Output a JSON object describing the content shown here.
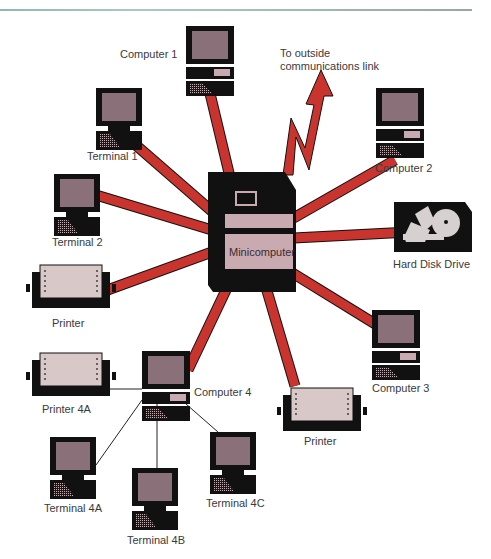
{
  "diagram": {
    "colors": {
      "link": "#c9352e",
      "device": "#111111",
      "screen": "#8a7078",
      "panel": "#c9aab0",
      "paper": "#d8c8c8",
      "topline": "#9fc2bd"
    },
    "hub": {
      "label": "Minicomputer",
      "icon": "minicomputer-icon"
    },
    "external_link": {
      "label_line1": "To outside",
      "label_line2": "communications link",
      "icon": "lightning-arrow-icon"
    },
    "nodes": [
      {
        "id": "computer-1",
        "label": "Computer 1",
        "icon": "computer-icon"
      },
      {
        "id": "computer-2",
        "label": "Computer 2",
        "icon": "computer-icon"
      },
      {
        "id": "computer-3",
        "label": "Computer 3",
        "icon": "computer-icon"
      },
      {
        "id": "computer-4",
        "label": "Computer 4",
        "icon": "computer-icon"
      },
      {
        "id": "terminal-1",
        "label": "Terminal 1",
        "icon": "terminal-icon"
      },
      {
        "id": "terminal-2",
        "label": "Terminal 2",
        "icon": "terminal-icon"
      },
      {
        "id": "printer-left",
        "label": "Printer",
        "icon": "printer-icon"
      },
      {
        "id": "printer-bottom",
        "label": "Printer",
        "icon": "printer-icon"
      },
      {
        "id": "hard-disk",
        "label": "Hard Disk Drive",
        "icon": "hard-disk-icon"
      },
      {
        "id": "printer-4a",
        "label": "Printer 4A",
        "icon": "printer-icon"
      },
      {
        "id": "terminal-4a",
        "label": "Terminal 4A",
        "icon": "terminal-icon"
      },
      {
        "id": "terminal-4b",
        "label": "Terminal 4B",
        "icon": "terminal-icon"
      },
      {
        "id": "terminal-4c",
        "label": "Terminal 4C",
        "icon": "terminal-icon"
      }
    ]
  }
}
